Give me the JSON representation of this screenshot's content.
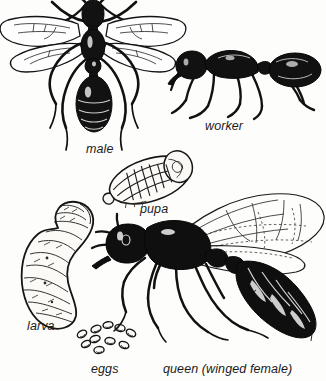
{
  "figure": {
    "background_color": "#fdfdfb",
    "ink_color": "#101010",
    "width": 326,
    "height": 381
  },
  "labels": [
    {
      "key": "male",
      "text": "male",
      "x": 86,
      "y": 142
    },
    {
      "key": "worker",
      "text": "worker",
      "x": 205,
      "y": 119
    },
    {
      "key": "pupa",
      "text": "pupa",
      "x": 140,
      "y": 202
    },
    {
      "key": "larva",
      "text": "larva",
      "x": 27,
      "y": 319
    },
    {
      "key": "eggs",
      "text": "eggs",
      "x": 91,
      "y": 362
    },
    {
      "key": "queen",
      "text": "queen (winged female)",
      "x": 163,
      "y": 362
    }
  ],
  "specimens": [
    {
      "key": "male",
      "caption": "male",
      "view": "dorsal",
      "wings": 4,
      "description": "winged male ant seen from above with two pairs of membranous wings and long legs"
    },
    {
      "key": "worker",
      "caption": "worker",
      "view": "lateral",
      "wings": 0,
      "description": "wingless worker ant in side view"
    },
    {
      "key": "pupa",
      "caption": "pupa",
      "view": "lateral",
      "wings": 0,
      "description": "pale naked pupa with folded appendages"
    },
    {
      "key": "larva",
      "caption": "larva",
      "view": "lateral",
      "wings": 0,
      "description": "C-shaped segmented grub-like larva"
    },
    {
      "key": "eggs",
      "caption": "eggs",
      "view": "cluster",
      "count": 10,
      "description": "cluster of ten small oval eggs"
    },
    {
      "key": "queen",
      "caption": "queen (winged female)",
      "view": "lateral",
      "wings": 4,
      "description": "large winged queen in side view with swollen gaster"
    }
  ],
  "egg_positions": [
    {
      "x": 96,
      "y": 329,
      "rx": 5.2,
      "ry": 3.4,
      "rot": -22
    },
    {
      "x": 108,
      "y": 325,
      "rx": 5.0,
      "ry": 3.3,
      "rot": -10
    },
    {
      "x": 120,
      "y": 328,
      "rx": 5.1,
      "ry": 3.4,
      "rot": 12
    },
    {
      "x": 82,
      "y": 334,
      "rx": 5.0,
      "ry": 3.3,
      "rot": -30
    },
    {
      "x": 95,
      "y": 339,
      "rx": 5.2,
      "ry": 3.4,
      "rot": -18
    },
    {
      "x": 131,
      "y": 333,
      "rx": 5.0,
      "ry": 3.3,
      "rot": 28
    },
    {
      "x": 110,
      "y": 341,
      "rx": 5.1,
      "ry": 3.4,
      "rot": 8
    },
    {
      "x": 124,
      "y": 345,
      "rx": 5.0,
      "ry": 3.3,
      "rot": 22
    },
    {
      "x": 99,
      "y": 350,
      "rx": 5.1,
      "ry": 3.4,
      "rot": -6
    },
    {
      "x": 86,
      "y": 344,
      "rx": 4.8,
      "ry": 3.2,
      "rot": -26
    }
  ]
}
